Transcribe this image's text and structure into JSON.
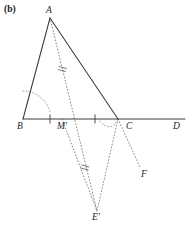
{
  "figure": {
    "panel_label": "(b)",
    "background_color": "#ffffff",
    "solid_line_color": "#3a3a3a",
    "dotted_line_color": "#8a8a8a",
    "label_color": "#1f1f1f",
    "width": 194,
    "height": 234
  },
  "points": {
    "A": {
      "label": "A",
      "x": 50,
      "y": 18,
      "label_x": 46,
      "label_y": 6
    },
    "B": {
      "label": "B",
      "x": 23,
      "y": 119,
      "label_x": 18,
      "label_y": 122
    },
    "C": {
      "label": "C",
      "x": 118,
      "y": 119,
      "label_x": 126,
      "label_y": 122
    },
    "D": {
      "label": "D",
      "x": 185,
      "y": 119,
      "label_x": 174,
      "label_y": 122
    },
    "M": {
      "label": "M'",
      "x": 62,
      "y": 119,
      "label_x": 57,
      "label_y": 122
    },
    "E": {
      "label": "E'",
      "x": 97,
      "y": 211,
      "label_x": 93,
      "label_y": 213
    },
    "F": {
      "label": "F",
      "x": 139,
      "y": 168,
      "label_x": 142,
      "label_y": 170
    }
  },
  "segments": {
    "solid": [
      {
        "name": "segment-AB",
        "from": "A",
        "to": "B"
      },
      {
        "name": "segment-AC",
        "from": "A",
        "to": "C"
      },
      {
        "name": "segment-BD-baseline",
        "from": "B",
        "to": "D"
      }
    ],
    "dotted": [
      {
        "name": "segment-A-Eprime",
        "from": "A",
        "to": "E"
      },
      {
        "name": "segment-Mprime-Eprime",
        "from": "M",
        "to": "E"
      },
      {
        "name": "segment-C-Eprime",
        "from": "C",
        "to": "E"
      },
      {
        "name": "segment-C-F",
        "from": "C",
        "to": "F"
      },
      {
        "name": "segment-B-arc-ray",
        "from": "B",
        "to": "C"
      }
    ]
  },
  "marks": {
    "baseline_ticks": [
      {
        "name": "tick-B-Mprime",
        "x": 50,
        "y": 119
      },
      {
        "name": "tick-Mprime-C",
        "x": 95,
        "y": 119
      }
    ],
    "congruence_hashes": [
      {
        "name": "hash-on-A-Eprime",
        "x": 62,
        "y": 70
      },
      {
        "name": "hash-on-Mprime-Eprime",
        "x": 84,
        "y": 168
      }
    ],
    "angle_arc_at_B": {
      "name": "angle-arc-B",
      "center_x": 23,
      "center_y": 119,
      "radius": 28
    }
  }
}
